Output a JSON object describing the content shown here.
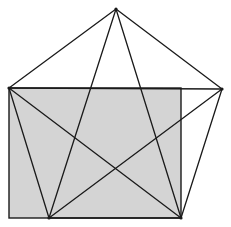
{
  "diagram": {
    "colors": {
      "background": "#ffffff",
      "rectangle_fill": "#d4d4d4",
      "stroke": "#1a1a1a"
    },
    "rectangle": {
      "x": 9,
      "y": 88,
      "width": 172,
      "height": 130
    },
    "vertices": {
      "top": [
        116,
        9
      ],
      "left": [
        9,
        88
      ],
      "right": [
        222,
        89
      ],
      "bottom_left": [
        49,
        218
      ],
      "bottom_right": [
        181,
        218
      ]
    },
    "pentagon_edges": [
      [
        "top",
        "right"
      ],
      [
        "right",
        "bottom_right"
      ],
      [
        "bottom_right",
        "bottom_left"
      ],
      [
        "bottom_left",
        "left"
      ],
      [
        "left",
        "top"
      ]
    ],
    "pentagram_diagonals": [
      [
        "top",
        "bottom_left"
      ],
      [
        "top",
        "bottom_right"
      ],
      [
        "left",
        "right"
      ],
      [
        "left",
        "bottom_right"
      ],
      [
        "right",
        "bottom_left"
      ]
    ]
  }
}
